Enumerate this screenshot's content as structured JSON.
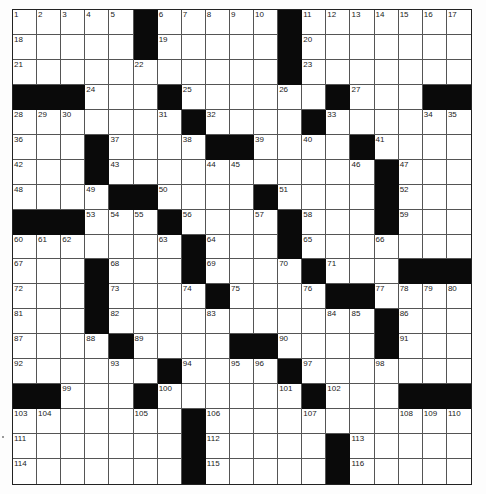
{
  "puzzle": {
    "cols": 19,
    "rows": 19,
    "grid": [
      [
        "1",
        "2",
        "3",
        "4",
        "5",
        "#",
        "6",
        "7",
        "8",
        "9",
        "10",
        "#",
        "11",
        "12",
        "13",
        "14",
        "15",
        "16",
        "17"
      ],
      [
        "18",
        ".",
        ".",
        ".",
        ".",
        "#",
        "19",
        ".",
        ".",
        ".",
        ".",
        "#",
        "20",
        ".",
        ".",
        ".",
        ".",
        ".",
        "."
      ],
      [
        "21",
        ".",
        ".",
        ".",
        ".",
        "22",
        ".",
        ".",
        ".",
        ".",
        ".",
        "#",
        "23",
        ".",
        ".",
        ".",
        ".",
        ".",
        "."
      ],
      [
        "#",
        "#",
        "#",
        "24",
        ".",
        ".",
        "#",
        "25",
        ".",
        ".",
        ".",
        "26",
        ".",
        "#",
        "27",
        ".",
        ".",
        "#",
        "#"
      ],
      [
        "28",
        "29",
        "30",
        ".",
        ".",
        ".",
        "31",
        "#",
        "32",
        ".",
        ".",
        ".",
        "#",
        "33",
        ".",
        ".",
        ".",
        "34",
        "35"
      ],
      [
        "36",
        ".",
        ".",
        "#",
        "37",
        ".",
        ".",
        "38",
        "#",
        "#",
        "39",
        ".",
        "40",
        ".",
        "#",
        "41",
        ".",
        ".",
        "."
      ],
      [
        "42",
        ".",
        ".",
        "#",
        "43",
        ".",
        ".",
        ".",
        "44",
        "45",
        ".",
        ".",
        ".",
        ".",
        "46",
        "#",
        "47",
        ".",
        "."
      ],
      [
        "48",
        ".",
        ".",
        "49",
        "#",
        "#",
        "50",
        ".",
        ".",
        ".",
        "#",
        "51",
        ".",
        ".",
        ".",
        "#",
        "52",
        ".",
        "."
      ],
      [
        "#",
        "#",
        "#",
        "53",
        "54",
        "55",
        "#",
        "56",
        ".",
        ".",
        "57",
        "#",
        "58",
        ".",
        ".",
        "#",
        "59",
        ".",
        "."
      ],
      [
        "60",
        "61",
        "62",
        ".",
        ".",
        ".",
        "63",
        "#",
        "64",
        ".",
        ".",
        "#",
        "65",
        ".",
        ".",
        "66",
        ".",
        ".",
        "."
      ],
      [
        "67",
        ".",
        ".",
        "#",
        "68",
        ".",
        ".",
        "#",
        "69",
        ".",
        ".",
        "70",
        "#",
        "71",
        ".",
        ".",
        "#",
        "#",
        "#"
      ],
      [
        "72",
        ".",
        ".",
        "#",
        "73",
        ".",
        ".",
        "74",
        "#",
        "75",
        ".",
        ".",
        "76",
        "#",
        "#",
        "77",
        "78",
        "79",
        "80"
      ],
      [
        "81",
        ".",
        ".",
        "#",
        "82",
        ".",
        ".",
        ".",
        "83",
        ".",
        ".",
        ".",
        ".",
        "84",
        "85",
        "#",
        "86",
        ".",
        "."
      ],
      [
        "87",
        ".",
        ".",
        "88",
        "#",
        "89",
        ".",
        ".",
        ".",
        "#",
        "#",
        "90",
        ".",
        ".",
        ".",
        "#",
        "91",
        ".",
        "."
      ],
      [
        "92",
        ".",
        ".",
        ".",
        "93",
        ".",
        "#",
        "94",
        ".",
        "95",
        "96",
        "#",
        "97",
        ".",
        ".",
        "98",
        ".",
        ".",
        "."
      ],
      [
        "#",
        "#",
        "99",
        ".",
        ".",
        "#",
        "100",
        ".",
        ".",
        ".",
        ".",
        "101",
        "#",
        "102",
        ".",
        ".",
        "#",
        "#",
        "#"
      ],
      [
        "103",
        "104",
        ".",
        ".",
        ".",
        "105",
        ".",
        "#",
        "106",
        ".",
        ".",
        ".",
        "107",
        ".",
        ".",
        ".",
        "108",
        "109",
        "110"
      ],
      [
        "111",
        ".",
        ".",
        ".",
        ".",
        ".",
        ".",
        "#",
        "112",
        ".",
        ".",
        ".",
        ".",
        "#",
        "113",
        ".",
        ".",
        ".",
        "."
      ],
      [
        "114",
        ".",
        ".",
        ".",
        ".",
        ".",
        ".",
        "#",
        "115",
        ".",
        ".",
        ".",
        ".",
        "#",
        "116",
        ".",
        ".",
        ".",
        "."
      ]
    ]
  },
  "colors": {
    "black_cell": "#0a0a0a",
    "white_cell": "#ffffff",
    "grid_line": "#555555"
  }
}
